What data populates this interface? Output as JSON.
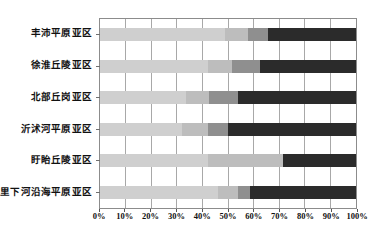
{
  "chart_data": {
    "type": "bar",
    "orientation": "horizontal",
    "stacked": "percent",
    "title": "",
    "subtitle": "",
    "xlabel": "",
    "ylabel": "",
    "xlim": [
      0,
      100
    ],
    "grid": true,
    "legend_position": "none",
    "categories": [
      "丰沛平原亚区",
      "徐淮丘陵亚区",
      "北部丘岗亚区",
      "沂沭河平原亚区",
      "盱眙丘陵亚区",
      "里下河沿海平原亚区"
    ],
    "xtick_labels": [
      "0%",
      "10%",
      "20%",
      "30%",
      "40%",
      "50%",
      "60%",
      "70%",
      "80%",
      "90%",
      "100%"
    ],
    "xtick_values": [
      0,
      10,
      20,
      30,
      40,
      50,
      60,
      70,
      80,
      90,
      100
    ],
    "series": [
      {
        "name": "series-1",
        "color": "#cfcfcf",
        "values": [
          49.0,
          42.0,
          33.5,
          32.0,
          42.0,
          46.0
        ]
      },
      {
        "name": "series-2",
        "color": "#bdbdbd",
        "values": [
          9.0,
          9.5,
          9.0,
          10.0,
          29.5,
          8.0
        ]
      },
      {
        "name": "series-3",
        "color": "#8f8f8f",
        "values": [
          7.5,
          11.0,
          11.5,
          8.0,
          0.0,
          4.5
        ]
      },
      {
        "name": "series-4",
        "color": "#2b2b2b",
        "values": [
          34.5,
          37.5,
          46.0,
          50.0,
          28.5,
          41.5
        ]
      }
    ]
  }
}
